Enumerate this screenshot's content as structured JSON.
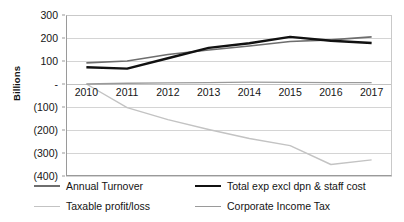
{
  "chart_data": {
    "type": "line",
    "title": "",
    "xlabel": "",
    "ylabel": "Billions",
    "categories": [
      "2010",
      "2011",
      "2012",
      "2013",
      "2014",
      "2015",
      "2016",
      "2017"
    ],
    "ylim": [
      -400,
      300
    ],
    "yticks": [
      300,
      200,
      100,
      0,
      -100,
      -200,
      -300,
      -400
    ],
    "ytick_labels": [
      "300",
      "200",
      "100",
      "-",
      "(100)",
      "(200)",
      "(300)",
      "(400)"
    ],
    "grid": true,
    "legend_position": "bottom",
    "series": [
      {
        "name": "Annual Turnover",
        "color": "#6e6e6e",
        "width": 1.6,
        "values": [
          92,
          100,
          128,
          148,
          165,
          185,
          192,
          205
        ]
      },
      {
        "name": "Total exp excl dpn & staff cost",
        "color": "#111111",
        "width": 2.4,
        "values": [
          73,
          67,
          112,
          157,
          177,
          205,
          188,
          178
        ]
      },
      {
        "name": "Taxable profit/loss",
        "color": "#c3c3c3",
        "width": 1.4,
        "values": [
          0,
          -103,
          -155,
          -198,
          -237,
          -268,
          -350,
          -330
        ]
      },
      {
        "name": "Corporate Income Tax",
        "color": "#9a9a9a",
        "width": 1.4,
        "values": [
          0,
          3,
          5,
          6,
          8,
          7,
          6,
          6
        ]
      }
    ]
  },
  "legend": {
    "items": [
      {
        "label": "Annual Turnover"
      },
      {
        "label": "Total exp excl dpn & staff cost"
      },
      {
        "label": "Taxable profit/loss"
      },
      {
        "label": "Corporate Income Tax"
      }
    ]
  }
}
